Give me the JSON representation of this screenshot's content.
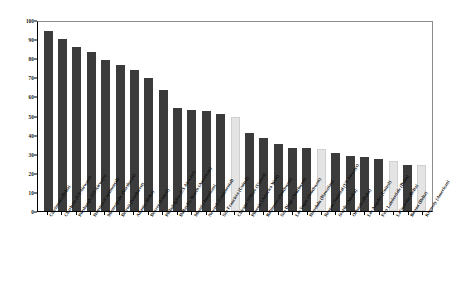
{
  "chart_data": {
    "type": "bar",
    "title": "",
    "xlabel": "",
    "ylabel": "",
    "ylim": [
      0,
      100
    ],
    "y_ticks": [
      0,
      10,
      20,
      30,
      40,
      50,
      60,
      70,
      80,
      90,
      100
    ],
    "grid": false,
    "legend": "none",
    "colors": {
      "bar": "#3b3b3b",
      "bar_highlight": "#e4e4e4",
      "axis": "#000000",
      "background": "#ffffff"
    },
    "categories": [
      "Cincinnati (Delta)",
      "Charlotte (US Airways)",
      "Pittsburgh (US Airways)",
      "Houston (Continental)",
      "Minneapolis (Northwest)",
      "Detroit (Northwest)",
      "Atlanta (Delta)",
      "Denver (United)",
      "Philadelphia (US Airways)",
      "Dallas/Ft. Worth (American)",
      "Miami (American)",
      "Newark (Continental)",
      "San Francisco (United)",
      "Chicago O'Hare (United)",
      "Phoenix (America West)",
      "Baltimore (Southwest)",
      "San Diego (Southwest)",
      "Las Vegas (Southwest)",
      "Honolulu (Hawaiian)",
      "Reagan National (US Airways)",
      "Seattle (Alaska)",
      "Orlando (Delta)",
      "Los Angeles (United)",
      "Fort Lauderdale (Delta)",
      "LaGuardia (Delta)",
      "Boston (Delta)",
      "Kennedy (American)"
    ],
    "values": [
      94,
      90,
      86,
      83,
      79,
      76.5,
      74,
      69.5,
      63.5,
      54,
      53,
      52.5,
      51,
      49,
      41,
      38,
      35,
      33,
      33,
      32.5,
      30.5,
      29,
      28.5,
      27,
      26,
      24,
      24
    ],
    "highlighted": [
      false,
      false,
      false,
      false,
      false,
      false,
      false,
      false,
      false,
      false,
      false,
      false,
      false,
      true,
      false,
      false,
      false,
      false,
      false,
      true,
      false,
      false,
      false,
      false,
      true,
      false,
      true
    ]
  }
}
